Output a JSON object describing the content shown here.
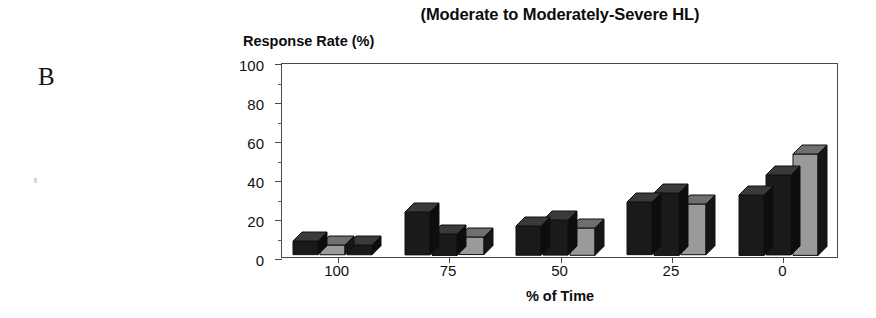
{
  "panel": {
    "letter": "B"
  },
  "chart_data": {
    "type": "bar",
    "title": "(Moderate to Moderately-Severe HL)",
    "xlabel": "% of Time",
    "ylabel": "Response Rate (%)",
    "categories": [
      "100",
      "75",
      "50",
      "25",
      "0"
    ],
    "ylim": [
      0,
      100
    ],
    "yticks": [
      0,
      20,
      40,
      60,
      80,
      100
    ],
    "yticks_minor": [
      10,
      30,
      50,
      70,
      90
    ],
    "grid": false,
    "legend": "none",
    "series": [
      {
        "name": "series-1",
        "color": "#1a1a1a",
        "values": [
          7,
          22,
          15,
          27,
          31
        ]
      },
      {
        "name": "series-2",
        "color": "#1a1a1a",
        "values": [
          5,
          11,
          18,
          32,
          41
        ]
      },
      {
        "name": "series-3",
        "color": "#9a9a9a",
        "values": [
          5,
          9,
          14,
          26,
          52
        ]
      }
    ],
    "series_colors_by_bar": [
      [
        "#1a1a1a",
        "#9a9a9a",
        "#1a1a1a"
      ],
      [
        "#1a1a1a",
        "#1a1a1a",
        "#9a9a9a"
      ],
      [
        "#1a1a1a",
        "#1a1a1a",
        "#9a9a9a"
      ],
      [
        "#1a1a1a",
        "#1a1a1a",
        "#9a9a9a"
      ],
      [
        "#1a1a1a",
        "#1a1a1a",
        "#9a9a9a"
      ]
    ]
  },
  "colors": {
    "dark_bar": "#1a1a1a",
    "gray_bar": "#9a9a9a",
    "gray_bar_top": "#6f6f6f",
    "dark_bar_top": "#3a3a3a",
    "axis": "#4a4a4a",
    "text": "#111111",
    "background": "#ffffff"
  }
}
